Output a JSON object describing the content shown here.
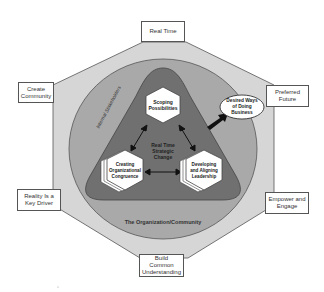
{
  "diagram": {
    "title": "Real Time Strategic Change",
    "colors": {
      "octagon_fill": "#d6d6d6",
      "circle_fill": "#a9a9a9",
      "triangle_fill": "#707070",
      "outline": "#555555",
      "hexagon_fill": "#ffffff",
      "arrow": "#111111"
    },
    "outer_labels": {
      "top": "Real Time",
      "top_left": [
        "Create",
        "Community"
      ],
      "top_right": [
        "Preferred",
        "Future"
      ],
      "bottom_left": [
        "Reality Is a",
        "Key Driver"
      ],
      "bottom_right": [
        "Empower and",
        "Engage"
      ],
      "bottom": [
        "Build Common",
        "Understanding"
      ]
    },
    "ring_labels": {
      "internal": "Internal Stakeholders",
      "organization": "The Organization/Community"
    },
    "center_label": [
      "Real Time",
      "Strategic",
      "Change"
    ],
    "hexagons": {
      "top": [
        "Scoping",
        "Possibilities"
      ],
      "left": [
        "Creating",
        "Organizational",
        "Congruence"
      ],
      "right": [
        "Developing",
        "and Aligning",
        "Leadership"
      ]
    },
    "outcome": [
      "Desired Ways",
      "of Doing",
      "Business"
    ]
  }
}
